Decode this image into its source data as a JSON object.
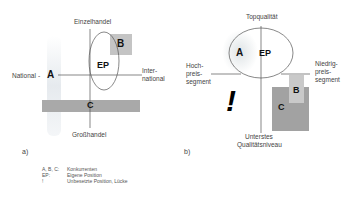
{
  "diagram_a": {
    "caption": "a)",
    "axis_top": "Einzelhandel",
    "axis_bottom": "Großhandel",
    "axis_left": "National",
    "axis_right_1": "Inter-",
    "axis_right_2": "national",
    "label_A": "A",
    "label_B": "B",
    "label_C": "C",
    "label_EP": "EP"
  },
  "diagram_b": {
    "caption": "b)",
    "axis_top": "Topqualität",
    "axis_bottom_1": "Unterstes",
    "axis_bottom_2": "Qualitätsniveau",
    "axis_left_1": "Hoch-",
    "axis_left_2": "preis-",
    "axis_left_3": "segment",
    "axis_right_1": "Niedrig-",
    "axis_right_2": "preis-",
    "axis_right_3": "segment",
    "label_A": "A",
    "label_B": "B",
    "label_C": "C",
    "label_EP": "EP",
    "gap_mark": "!"
  },
  "legend": {
    "items": [
      {
        "key": "A, B, C:",
        "value": "Konkurrenten"
      },
      {
        "key": "EP:",
        "value": "Eigene Position"
      },
      {
        "key": "!",
        "value": "Unbesetzte Position, Lücke"
      }
    ]
  },
  "colors": {
    "box_light": "#c8c8c8",
    "box_dark": "#a8a8a8",
    "bar_C": "#b0b0b0",
    "line": "#555555"
  }
}
